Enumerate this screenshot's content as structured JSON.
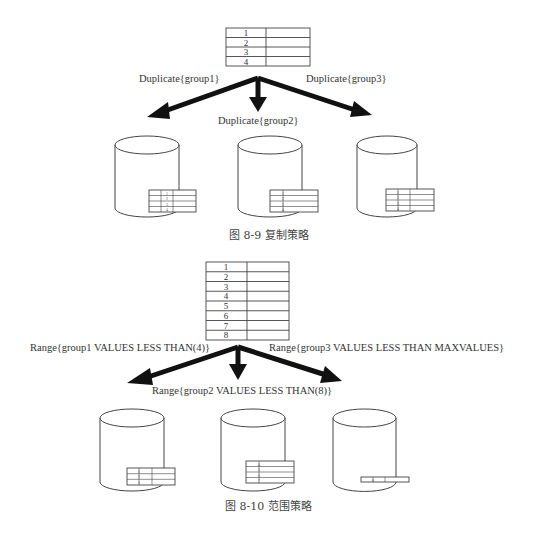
{
  "figure1": {
    "caption": "图 8-9   复制策略",
    "source_table": {
      "rows": [
        "1",
        "2",
        "3",
        "4"
      ]
    },
    "arrows": [
      {
        "label": "Duplicate{group1}"
      },
      {
        "label": "Duplicate{group2}"
      },
      {
        "label": "Duplicate{group3}"
      }
    ],
    "databases": [
      {
        "rows": [
          "1",
          "2",
          "3",
          "4"
        ]
      },
      {
        "rows": [
          "1",
          "2",
          "3",
          "4"
        ]
      },
      {
        "rows": [
          "1",
          "2",
          "3",
          "4"
        ]
      }
    ]
  },
  "figure2": {
    "caption": "图 8-10   范围策略",
    "source_table": {
      "rows": [
        "1",
        "2",
        "3",
        "4",
        "5",
        "6",
        "7",
        "8"
      ]
    },
    "arrows": [
      {
        "label": "Range{group1 VALUES LESS THAN(4)}"
      },
      {
        "label": "Range{group2 VALUES LESS THAN(8)}"
      },
      {
        "label": "Range{group3 VALUES LESS THAN MAXVALUES}"
      }
    ],
    "databases": [
      {
        "rows": [
          "1",
          "2",
          "3"
        ]
      },
      {
        "rows": [
          "4",
          "5",
          "6",
          "7"
        ]
      },
      {
        "rows": [
          "8"
        ]
      }
    ]
  }
}
